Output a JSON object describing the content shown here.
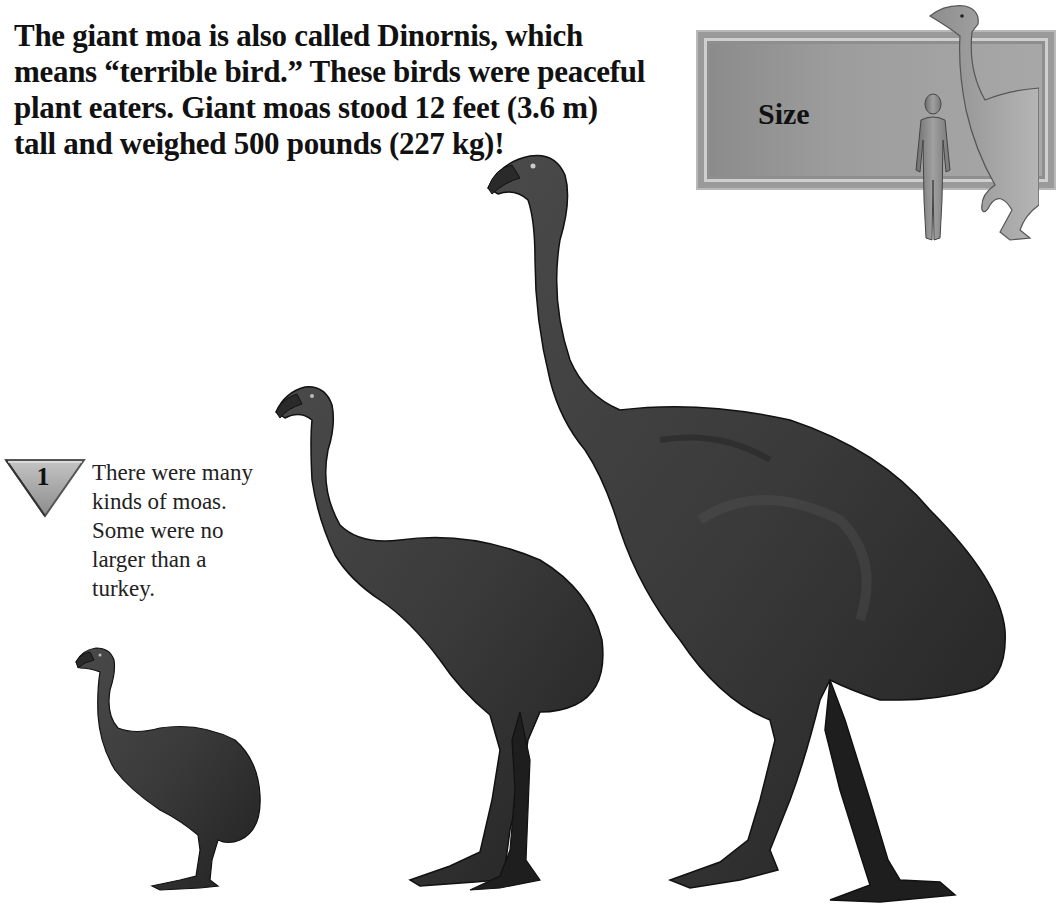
{
  "intro": {
    "lines": [
      "The giant moa is also called Dinornis, which",
      "means “terrible bird.”  These birds were peaceful",
      "plant eaters.  Giant moas stood 12 feet (3.6 m)",
      "tall and weighed 500 pounds (227 kg)!"
    ]
  },
  "size_panel": {
    "label": "Size",
    "icons": [
      "human-silhouette-icon",
      "moa-scale-icon"
    ]
  },
  "fact_box": {
    "badge_number": "1",
    "badge_shape": "inverted-triangle",
    "lines": [
      "There were many",
      "kinds of moas.",
      "Some were no",
      "larger than a",
      "turkey."
    ]
  },
  "illustrations": [
    {
      "name": "small-moa",
      "description": "turkey-sized moa"
    },
    {
      "name": "medium-moa",
      "description": "medium moa"
    },
    {
      "name": "giant-moa",
      "description": "giant moa (Dinornis)"
    }
  ],
  "colors": {
    "text": "#111111",
    "panel": "#9a9a9a",
    "bird_body": "#3a3a3a",
    "bird_dark": "#1c1c1c",
    "background": "#ffffff"
  }
}
